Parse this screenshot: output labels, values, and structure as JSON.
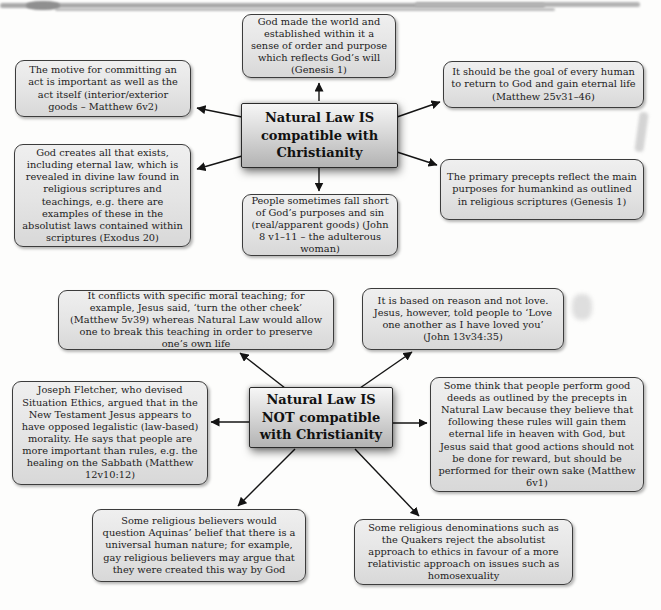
{
  "colors": {
    "node_fill": "#e6e6e6",
    "node_border": "#3c3c3c",
    "center_fill_top": "#f6f6f6",
    "center_fill_bottom": "#b3b3b3",
    "arrow": "#141414",
    "background": "#fdfdfc"
  },
  "diagram1": {
    "center": {
      "label": "Natural Law IS compatible with Christianity"
    },
    "nodes": [
      {
        "id": "god-made-world",
        "text": "God made the world and established within it a sense of order and purpose which reflects God’s will (Genesis 1)"
      },
      {
        "id": "motive-of-act",
        "text": "The motive for committing an act is important as well as the act itself (interior/exterior goods – Matthew 6v2)"
      },
      {
        "id": "goal-eternal-life",
        "text": "It should be the goal of every human to return to God and gain eternal life (Matthew 25v31–46)"
      },
      {
        "id": "god-creates-all",
        "text": "God creates all that exists, including eternal law, which is revealed in divine law found in religious scriptures and teachings, e.g. there are examples of these in the absolutist laws contained within scriptures (Exodus 20)"
      },
      {
        "id": "primary-precepts",
        "text": "The primary precepts reflect the main purposes for humankind as outlined in religious scriptures (Genesis 1)"
      },
      {
        "id": "fall-short-sin",
        "text": "People sometimes fall short of God’s purposes and sin (real/apparent goods) (John 8 v1–11 – the adulterous woman)"
      }
    ]
  },
  "diagram2": {
    "center": {
      "label": "Natural Law IS NOT compatible with Christianity"
    },
    "nodes": [
      {
        "id": "conflicts-moral-teaching",
        "text": "It conflicts with specific moral teaching; for example, Jesus said, ‘turn the other cheek’ (Matthew 5v39) whereas Natural Law would allow one to break this teaching in order to preserve one’s own life"
      },
      {
        "id": "reason-not-love",
        "text": "It is based on reason and not love. Jesus, however, told people to ‘Love one another as I have loved you’ (John 13v34:35)"
      },
      {
        "id": "joseph-fletcher",
        "text": "Joseph Fletcher, who devised Situation Ethics, argued that in the New Testament Jesus appears to have opposed legalistic (law-based) morality. He says that people are more important than rules, e.g. the healing on the Sabbath (Matthew 12v10:12)"
      },
      {
        "id": "deeds-for-reward",
        "text": "Some think that people perform good deeds as outlined by the precepts in Natural Law because they believe that following these rules will gain them eternal life in heaven with God, but Jesus said that good actions should not be done for reward, but should be performed for their own sake (Matthew 6v1)"
      },
      {
        "id": "question-universal-nature",
        "text": "Some religious believers would question Aquinas’ belief that there is a universal human nature; for example, gay religious believers may argue that they were created this way by God"
      },
      {
        "id": "quakers-relativistic",
        "text": "Some religious denominations such as the Quakers reject the absolutist approach to ethics in favour of a more relativistic approach on issues such as homosexuality"
      }
    ]
  }
}
